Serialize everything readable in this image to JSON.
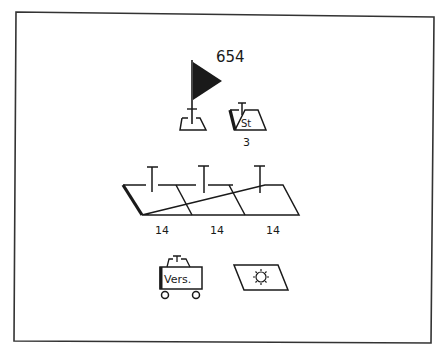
{
  "diagram": {
    "colors": {
      "ink": "#1a1a1a",
      "background": "#ffffff",
      "frame": "#333333"
    },
    "flag_symbol": {
      "label": "654"
    },
    "st_symbol": {
      "inner_text": "St",
      "count": "3"
    },
    "chain_symbols": {
      "labels": [
        "14",
        "14",
        "14"
      ]
    },
    "cart_symbol": {
      "inner_text": "Vers."
    },
    "sun_symbol": {
      "icon": "sun-icon"
    }
  }
}
